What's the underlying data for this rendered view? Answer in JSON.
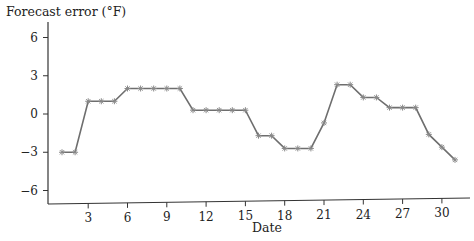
{
  "chart_data": {
    "type": "line",
    "title": "",
    "xlabel": "Date",
    "ylabel": "Forecast error (°F)",
    "x": [
      1,
      2,
      3,
      4,
      5,
      6,
      7,
      8,
      9,
      10,
      11,
      12,
      13,
      14,
      15,
      16,
      17,
      18,
      19,
      20,
      21,
      22,
      23,
      24,
      25,
      26,
      27,
      28,
      29,
      30,
      31
    ],
    "series": [
      {
        "name": "Forecast error",
        "values": [
          -3,
          -3,
          1,
          1,
          1,
          2,
          2,
          2,
          2,
          2,
          0.3,
          0.3,
          0.3,
          0.3,
          0.3,
          -1.7,
          -1.7,
          -2.7,
          -2.7,
          -2.7,
          -0.7,
          2.3,
          2.3,
          1.3,
          1.3,
          0.5,
          0.5,
          0.5,
          -1.6,
          -2.6,
          -3.6
        ],
        "color": "#6e6e6e",
        "marker": "asterisk"
      }
    ],
    "xticks": [
      3,
      6,
      9,
      12,
      15,
      18,
      21,
      24,
      27,
      30
    ],
    "yticks": [
      -6,
      -3,
      0,
      3,
      6
    ],
    "xlim": [
      0,
      32
    ],
    "ylim": [
      -7,
      7
    ],
    "grid": false,
    "legend": "none"
  },
  "labels": {
    "y_title": "Forecast error (°F)",
    "x_title": "Date"
  }
}
